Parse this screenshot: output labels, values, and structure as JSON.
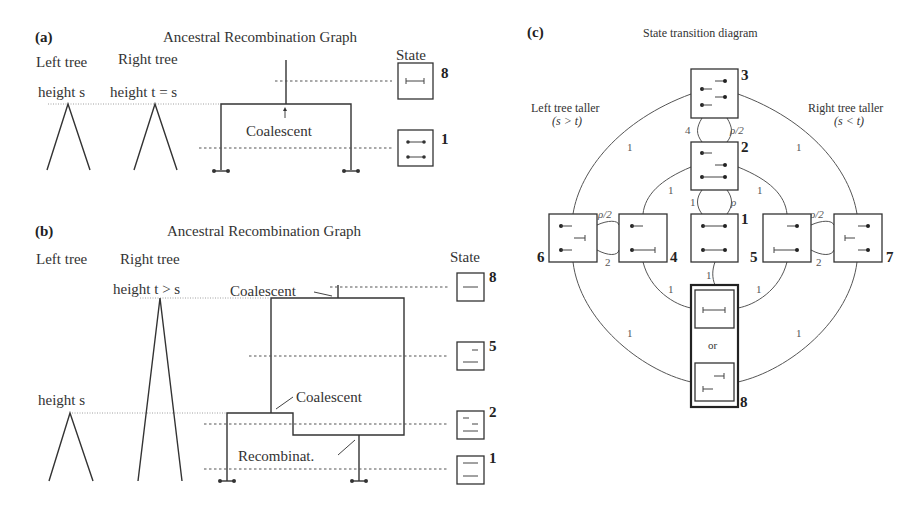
{
  "panel_a": {
    "label": "(a)",
    "title": "Ancestral Recombination Graph",
    "left_tree": "Left tree",
    "right_tree": "Right tree",
    "left_height": "height s",
    "right_height": "height t = s",
    "state_header": "State",
    "coalescent": "Coalescent",
    "states": [
      "8",
      "1"
    ]
  },
  "panel_b": {
    "label": "(b)",
    "title": "Ancestral Recombination Graph",
    "left_tree": "Left tree",
    "right_tree": "Right tree",
    "right_height": "height t > s",
    "left_height": "height s",
    "state_header": "State",
    "coalescent_top": "Coalescent",
    "coalescent_mid": "Coalescent",
    "recombination": "Recombinat.",
    "states": [
      "8",
      "5",
      "2",
      "1"
    ]
  },
  "panel_c": {
    "label": "(c)",
    "title": "State transition diagram",
    "left_note": "Left tree taller",
    "left_cond": "(s > t)",
    "right_note": "Right tree taller",
    "right_cond": "(s < t)",
    "states": [
      "3",
      "2",
      "1",
      "4",
      "5",
      "6",
      "7",
      "8"
    ],
    "or_label": "or",
    "rates": {
      "r3_2_left": "4",
      "r3_2_right": "ρ/2",
      "r2_1_left": "1",
      "r2_1_right": "ρ",
      "r6_4_top": "ρ/2",
      "r6_4_bottom": "2",
      "r5_7_top": "ρ/2",
      "r5_7_bottom": "2",
      "r1_8": "1",
      "outer": "1"
    }
  }
}
